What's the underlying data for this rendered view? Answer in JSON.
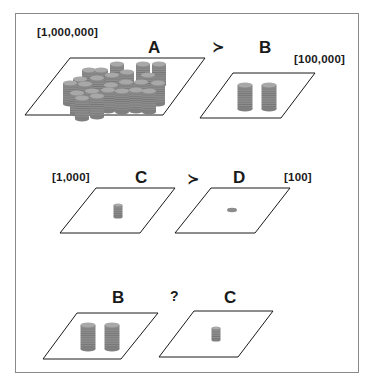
{
  "rows": [
    {
      "left": {
        "letter": "A",
        "amount": "[1,000,000]",
        "coin_stacks": 24
      },
      "relation": "≻",
      "right": {
        "letter": "B",
        "amount": "[100,000]",
        "coin_stacks": 2
      }
    },
    {
      "left": {
        "letter": "C",
        "amount": "[1,000]",
        "coin_stacks": 1
      },
      "relation": "≻",
      "right": {
        "letter": "D",
        "amount": "[100]",
        "coin_stacks": 0,
        "single_coin": true
      }
    },
    {
      "left": {
        "letter": "B",
        "coin_stacks": 2
      },
      "relation": "?",
      "right": {
        "letter": "C",
        "coin_stacks": 1
      }
    }
  ],
  "colors": {
    "frame": "#8a8a8a",
    "plane_stroke": "#1a1a1a",
    "coin_body": "#8c8c8c",
    "coin_top": "#a8a8a8",
    "coin_line": "#6e6e6e"
  }
}
